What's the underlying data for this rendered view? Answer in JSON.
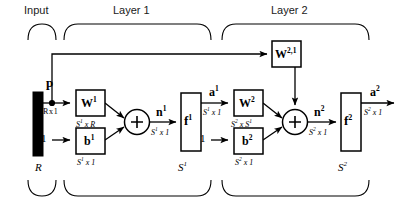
{
  "diagram": {
    "groups": [
      {
        "id": "input",
        "label": "Input"
      },
      {
        "id": "layer1",
        "label": "Layer 1"
      },
      {
        "id": "layer2",
        "label": "Layer 2"
      }
    ],
    "input_block": {
      "name": "input-vector",
      "symbol": "p",
      "dimension": "R x 1",
      "size_label": "R",
      "fill_color": "#000000"
    },
    "bias_sources": [
      {
        "id": "bias1-source",
        "label": "1"
      },
      {
        "id": "bias2-source",
        "label": "1"
      }
    ],
    "blocks": [
      {
        "id": "w1",
        "symbol": "W",
        "superscript": "1",
        "dimension": "S¹ x R",
        "dim_base": "S",
        "dim_sup": "1",
        "dim_rest": " x R"
      },
      {
        "id": "b1",
        "symbol": "b",
        "superscript": "1",
        "dimension": "S¹ x 1",
        "dim_base": "S",
        "dim_sup": "1",
        "dim_rest": " x 1"
      },
      {
        "id": "w21",
        "symbol": "W",
        "superscript": "2,1",
        "dimension": "",
        "dim_base": "",
        "dim_sup": "",
        "dim_rest": ""
      },
      {
        "id": "f1",
        "symbol": "f",
        "superscript": "1",
        "dimension": "",
        "size_label": "S",
        "size_sup": "1"
      },
      {
        "id": "w2",
        "symbol": "W",
        "superscript": "2",
        "dimension": "S² x S¹",
        "dim_base": "S",
        "dim_sup": "2",
        "dim_rest": " x S",
        "dim_rest_sup": "1"
      },
      {
        "id": "b2",
        "symbol": "b",
        "superscript": "2",
        "dimension": "S² x 1",
        "dim_base": "S",
        "dim_sup": "2",
        "dim_rest": " x 1"
      },
      {
        "id": "f2",
        "symbol": "f",
        "superscript": "2",
        "dimension": "",
        "size_label": "S",
        "size_sup": "2"
      }
    ],
    "sum_junctions": [
      {
        "id": "sum1",
        "glyph": "+"
      },
      {
        "id": "sum2",
        "glyph": "+"
      }
    ],
    "signals": [
      {
        "id": "n1",
        "symbol": "n",
        "superscript": "1",
        "dim_base": "S",
        "dim_sup": "1",
        "dim_rest": " x 1"
      },
      {
        "id": "a1",
        "symbol": "a",
        "superscript": "1",
        "dim_base": "S",
        "dim_sup": "1",
        "dim_rest": " x 1"
      },
      {
        "id": "n2",
        "symbol": "n",
        "superscript": "2",
        "dim_base": "S",
        "dim_sup": "2",
        "dim_rest": " x 1"
      },
      {
        "id": "a2",
        "symbol": "a",
        "superscript": "2",
        "dim_base": "S",
        "dim_sup": "2",
        "dim_rest": " x 1"
      }
    ],
    "region_sizes": [
      {
        "id": "size-input",
        "base": "R",
        "sup": ""
      },
      {
        "id": "size-layer1",
        "base": "S",
        "sup": "1"
      },
      {
        "id": "size-layer2",
        "base": "S",
        "sup": "2"
      }
    ],
    "colors": {
      "stroke": "#000000",
      "background": "#ffffff",
      "input_bar": "#000000",
      "title_text": "#1a1a1a"
    }
  }
}
